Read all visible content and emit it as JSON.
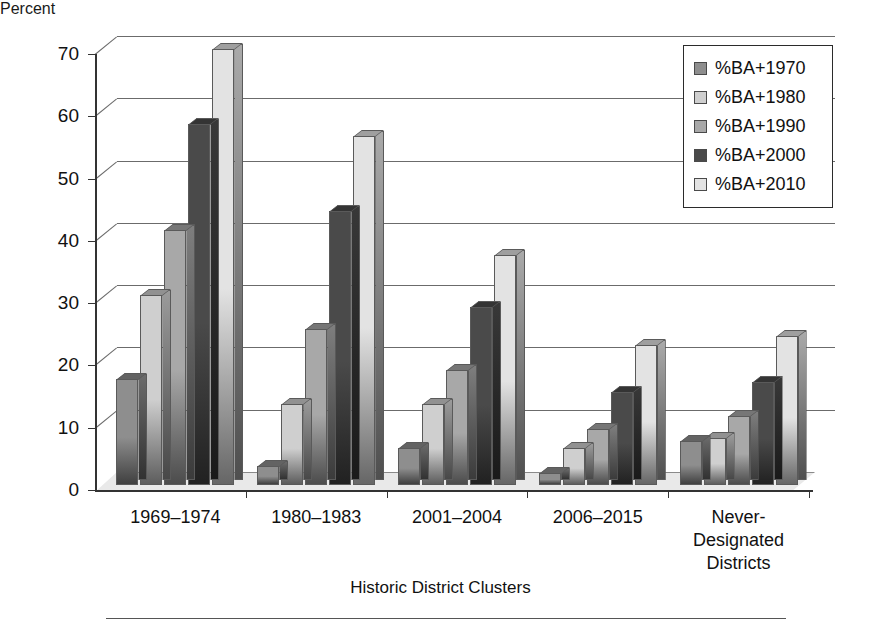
{
  "chart_data": {
    "type": "bar",
    "title": "",
    "subtitle": "",
    "xlabel": "Historic District Clusters",
    "ylabel": "Percent",
    "ylim": [
      0,
      70
    ],
    "ytick_step": 10,
    "yticks": [
      "70",
      "60",
      "50",
      "40",
      "30",
      "20",
      "10",
      "0"
    ],
    "grid": true,
    "grid_axis": "y",
    "legend_position": "top-right",
    "style": "3d-clustered-column",
    "categories": [
      "1969–1974",
      "1980–1983",
      "2001–2004",
      "2006–2015",
      "Never-\nDesignated\nDistricts"
    ],
    "series": [
      {
        "name": "%BA+1970",
        "color": "#8e8e8e",
        "values": [
          17.0,
          3.0,
          6.0,
          2.0,
          7.0
        ]
      },
      {
        "name": "%BA+1980",
        "color": "#cfcfcf",
        "values": [
          30.5,
          13.0,
          13.0,
          6.0,
          7.5
        ]
      },
      {
        "name": "%BA+1990",
        "color": "#a8a8a8",
        "values": [
          41.0,
          25.0,
          18.5,
          9.0,
          11.0
        ]
      },
      {
        "name": "%BA+2000",
        "color": "#4a4a4a",
        "values": [
          58.0,
          44.0,
          28.5,
          15.0,
          16.5
        ]
      },
      {
        "name": "%BA+2010",
        "color": "#e3e3e3",
        "values": [
          70.0,
          56.0,
          37.0,
          22.5,
          24.0
        ]
      }
    ]
  },
  "legend": {
    "items": [
      {
        "label": "%BA+1970"
      },
      {
        "label": "%BA+1980"
      },
      {
        "label": "%BA+1990"
      },
      {
        "label": "%BA+2000"
      },
      {
        "label": "%BA+2010"
      }
    ]
  },
  "axes": {
    "y_title": "Percent",
    "x_title": "Historic District Clusters"
  }
}
